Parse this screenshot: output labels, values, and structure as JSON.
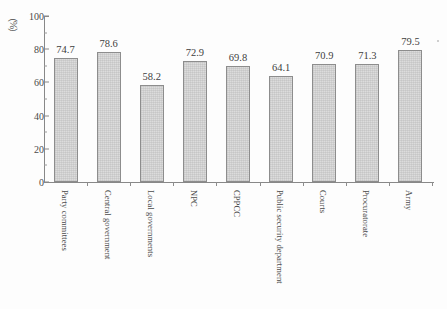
{
  "chart_data": {
    "type": "bar",
    "title": "",
    "xlabel": "",
    "ylabel": "（%）",
    "ylim": [
      0,
      100
    ],
    "ytick_step": 20,
    "yticks": [
      0,
      20,
      40,
      60,
      80,
      100
    ],
    "ytick_labels": [
      "0",
      "20",
      "40",
      "60",
      "80",
      "100"
    ],
    "grid": false,
    "legend": null,
    "categories": [
      "Party committees",
      "Central government",
      "Local governments",
      "NPC",
      "CPPCC",
      "Public security department",
      "Courts",
      "Procuratorate",
      "Army"
    ],
    "values": [
      74.7,
      78.6,
      58.2,
      72.9,
      69.8,
      64.1,
      70.9,
      71.3,
      79.5
    ],
    "value_labels": [
      "74.7",
      "78.6",
      "58.2",
      "72.9",
      "69.8",
      "64.1",
      "70.9",
      "71.3",
      "79.5"
    ],
    "bar_fill_color": "#dcdcdc",
    "bar_edge_color": "#8d8d8d",
    "axis_color": "#888888",
    "text_color": "#3d3d3d",
    "background_color": "#fdfdfd"
  }
}
